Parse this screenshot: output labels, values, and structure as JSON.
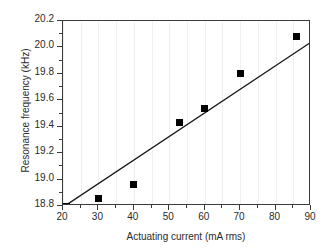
{
  "chart_data": {
    "type": "scatter",
    "title": "",
    "xlabel": "Actuating current (mA rms)",
    "ylabel": "Resonance frequency (kHz)",
    "xlim": [
      20,
      90
    ],
    "ylim": [
      18.8,
      20.2
    ],
    "xticks": [
      20,
      30,
      40,
      50,
      60,
      70,
      80,
      90
    ],
    "xticklabels": [
      "20",
      "30",
      "40",
      "50",
      "60",
      "70",
      "80",
      "90"
    ],
    "yticks": [
      18.8,
      19.0,
      19.2,
      19.4,
      19.6,
      19.8,
      20.0,
      20.2
    ],
    "yticklabels": [
      "18.8",
      "19.0",
      "19.2",
      "19.4",
      "19.6",
      "19.8",
      "20.0",
      "20.2"
    ],
    "x_minor_tick_step": 5,
    "y_minor_tick_step": 0.1,
    "grid": "vertical-minor-light",
    "legend": "none",
    "marker": "filled-square",
    "marker_color": "#000000",
    "line_color": "#1a1a1a",
    "series": [
      {
        "name": "measured",
        "kind": "scatter",
        "x": [
          21,
          30,
          40,
          53,
          60,
          70,
          86
        ],
        "y": [
          18.8,
          18.86,
          18.96,
          19.43,
          19.54,
          19.8,
          20.08
        ]
      },
      {
        "name": "linear fit",
        "kind": "line",
        "x": [
          20.5,
          90
        ],
        "y": [
          18.8,
          20.04
        ]
      }
    ]
  },
  "axes": {
    "x_title": "Actuating current (mA rms)",
    "y_title": "Resonance frequency (kHz)"
  }
}
